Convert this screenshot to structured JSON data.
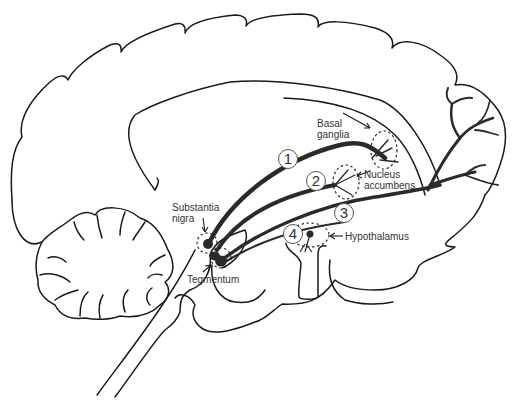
{
  "diagram": {
    "colors": {
      "outline": "#1a1a1a",
      "pathway": "#2a2a2a",
      "label_text": "#333333"
    },
    "labels": {
      "basal_ganglia_line1": "Basal",
      "basal_ganglia_line2": "ganglia",
      "nucleus_accumbens_line1": "Nucleus",
      "nucleus_accumbens_line2": "accumbens",
      "substantia_nigra_line1": "Substantia",
      "substantia_nigra_line2": "nigra",
      "tegmentum": "Tegmentum",
      "hypothalamus": "Hypothalamus"
    },
    "pathway_numbers": [
      "1",
      "2",
      "3",
      "4"
    ]
  }
}
